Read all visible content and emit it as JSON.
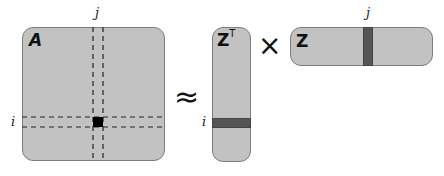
{
  "diagram": {
    "type": "matrix-factorization",
    "relation": "A ≈ Zᵀ × Z",
    "matrices": {
      "A": {
        "label": "A",
        "row_index": "i",
        "col_index": "j",
        "highlight": "element (i, j)"
      },
      "ZT": {
        "label": "Z",
        "superscript": "T",
        "row_index": "i",
        "highlight": "row i"
      },
      "Z": {
        "label": "Z",
        "col_index": "j",
        "highlight": "column j"
      }
    },
    "operators": {
      "approx": "≈",
      "times": "×"
    },
    "colors": {
      "matrix_fill": "#c2c2c2",
      "matrix_border": "#7d7d7d",
      "highlight_band": "#555555",
      "highlight_cell": "#000000",
      "dashed_lines": "#222222"
    }
  }
}
